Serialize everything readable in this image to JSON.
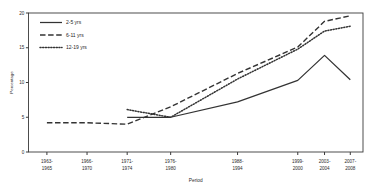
{
  "chart_data": {
    "type": "line",
    "title": "",
    "xlabel": "Period",
    "ylabel": "Percentage",
    "ylim": [
      0,
      20
    ],
    "yticks": [
      0,
      5,
      10,
      15,
      20
    ],
    "grid": false,
    "legend_position": "upper-left",
    "categories": [
      "1963-\n1965",
      "1966-\n1970",
      "1971-\n1974",
      "1976-\n1980",
      "1988-\n1994",
      "1999-\n2000",
      "2003-\n2004",
      "2007-\n2008"
    ],
    "categories_flat": [
      "1963-1965",
      "1966-1970",
      "1971-1974",
      "1976-1980",
      "1988-1994",
      "1999-2000",
      "2003-2004",
      "2007-2008"
    ],
    "category_lines": [
      [
        "1963-",
        "1965"
      ],
      [
        "1966-",
        "1970"
      ],
      [
        "1971-",
        "1974"
      ],
      [
        "1976-",
        "1980"
      ],
      [
        "1988-",
        "1994"
      ],
      [
        "1999-",
        "2000"
      ],
      [
        "2003-",
        "2004"
      ],
      [
        "2007-",
        "2008"
      ]
    ],
    "series": [
      {
        "name": "2-5 yrs",
        "style": "solid",
        "color": "#333333",
        "x": [
          "1971-1974",
          "1976-1980",
          "1988-1994",
          "1999-2000",
          "2003-2004",
          "2007-2008"
        ],
        "values": [
          5.0,
          5.0,
          7.2,
          10.3,
          13.9,
          10.4
        ]
      },
      {
        "name": "6-11 yrs",
        "style": "dashed",
        "color": "#333333",
        "x": [
          "1963-1965",
          "1966-1970",
          "1971-1974",
          "1976-1980",
          "1988-1994",
          "1999-2000",
          "2003-2004",
          "2007-2008"
        ],
        "values": [
          4.2,
          4.2,
          4.0,
          6.5,
          11.3,
          15.1,
          18.8,
          19.6
        ]
      },
      {
        "name": "12-19 yrs",
        "style": "dotted",
        "color": "#333333",
        "x": [
          "1971-1974",
          "1976-1980",
          "1988-1994",
          "1999-2000",
          "2003-2004",
          "2007-2008"
        ],
        "values": [
          6.1,
          5.0,
          10.5,
          14.8,
          17.4,
          18.1
        ]
      }
    ],
    "annotations": []
  },
  "legend": {
    "entries": [
      {
        "label": "2-5 yrs",
        "swatch": "solid-line-swatch"
      },
      {
        "label": "6-11 yrs",
        "swatch": "dashed-line-swatch"
      },
      {
        "label": "12-19 yrs",
        "swatch": "dotted-line-swatch"
      }
    ]
  },
  "axes": {
    "y_title": "Percentage",
    "x_title": "Period",
    "y_tick_labels": [
      "0",
      "5",
      "10",
      "15",
      "20"
    ]
  },
  "colors": {
    "line": "#333333",
    "axis": "#3a3a3a",
    "text": "#2b2b2b",
    "background": "#ffffff"
  }
}
